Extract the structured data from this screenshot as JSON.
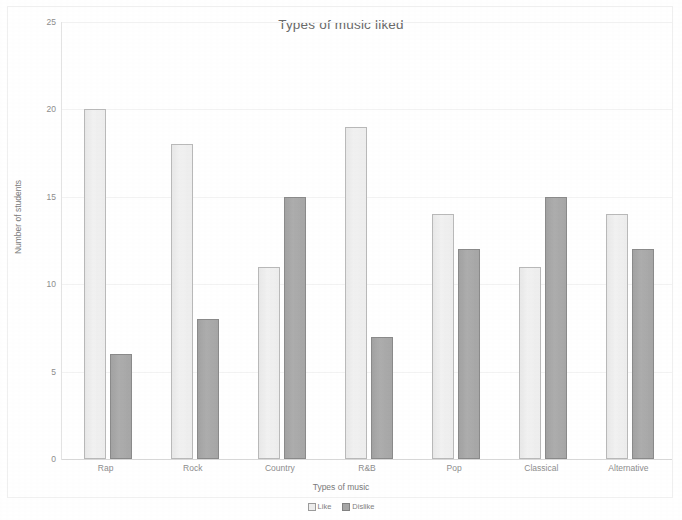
{
  "chart_data": {
    "type": "bar",
    "title": "Types of music liked",
    "xlabel": "Types of music",
    "ylabel": "Number of students",
    "categories": [
      "Rap",
      "Rock",
      "Country",
      "R&B",
      "Pop",
      "Classical",
      "Alternative"
    ],
    "series": [
      {
        "name": "Like",
        "color": "#ededed",
        "values": [
          20,
          18,
          11,
          19,
          14,
          11,
          14
        ]
      },
      {
        "name": "Dislike",
        "color": "#a6a6a6",
        "values": [
          6,
          8,
          15,
          7,
          12,
          15,
          12
        ]
      }
    ],
    "ylim": [
      0,
      25
    ],
    "ytick_labels": [
      "25",
      "20",
      "15",
      "10",
      "5",
      "0"
    ],
    "ytick_values": [
      25,
      20,
      15,
      10,
      5,
      0
    ],
    "grid": true,
    "legend_position": "bottom"
  }
}
